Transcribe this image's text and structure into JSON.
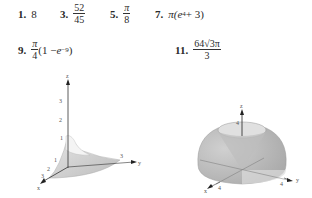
{
  "answers": [
    {
      "number": "1.",
      "value": "8"
    },
    {
      "number": "3.",
      "numerator": "52",
      "denominator": "45"
    },
    {
      "number": "5.",
      "numerator": "π",
      "denominator": "8"
    },
    {
      "number": "7.",
      "prefix": "π(",
      "base": "e",
      "exponent": "4",
      "suffix": " + 3)"
    },
    {
      "number": "9.",
      "numerator": "π",
      "denominator": "4",
      "suffix_a": "(1 − ",
      "base": "e",
      "exponent": "−9",
      "suffix_b": ")"
    },
    {
      "number": "11.",
      "numerator": "64√3π",
      "denominator": "3"
    }
  ],
  "figures": [
    {
      "axes": {
        "x": "x",
        "y": "y",
        "z": "z"
      },
      "z_ticks": [
        "1",
        "2",
        "3"
      ],
      "y_ticks": [
        "3"
      ],
      "x_ticks": [
        "1",
        "2",
        "3"
      ]
    },
    {
      "axes": {
        "x": "x",
        "y": "y",
        "z": "z"
      },
      "z_ticks": [
        "4"
      ],
      "y_ticks": [
        "4"
      ],
      "x_ticks": [
        "4"
      ]
    }
  ]
}
